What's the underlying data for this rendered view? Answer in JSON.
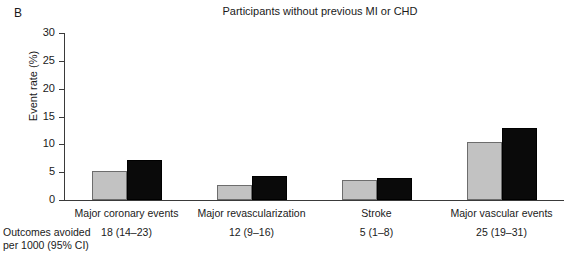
{
  "panel": {
    "letter": "B"
  },
  "chart_data": {
    "type": "bar",
    "title": "Participants without previous MI or CHD",
    "xlabel": "",
    "ylabel": "Event rate (%)",
    "ylim": [
      0,
      30
    ],
    "yticks": [
      0,
      5,
      10,
      15,
      20,
      25,
      30
    ],
    "ytick_labels": [
      "0",
      "5",
      "10",
      "15",
      "20",
      "25",
      "30"
    ],
    "grid": false,
    "legend": "none",
    "categories": [
      "Major coronary events",
      "Major revascularization",
      "Stroke",
      "Major vascular events"
    ],
    "series": [
      {
        "name": "Treatment",
        "color": "#c2c2c2",
        "values": [
          5.2,
          2.7,
          3.6,
          10.4
        ]
      },
      {
        "name": "Control",
        "color": "#0a0a0a",
        "values": [
          7.2,
          4.3,
          4.0,
          12.9
        ]
      }
    ],
    "annotations": {
      "label": "Outcomes avoided\nper 1000 (95% CI)",
      "label_line1": "Outcomes avoided",
      "label_line2": "per 1000 (95% CI)",
      "values": [
        "18 (14–23)",
        "12 (9–16)",
        "5 (1–8)",
        "25 (19–31)"
      ]
    }
  }
}
